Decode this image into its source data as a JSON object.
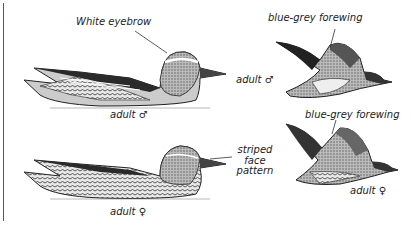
{
  "illustration": {
    "subject": "Garganey ducks",
    "figures": [
      {
        "id": "male-swimming",
        "caption": "adult ♂"
      },
      {
        "id": "female-swimming",
        "caption": "adult ♀"
      },
      {
        "id": "male-flying",
        "caption": "adult ♂"
      },
      {
        "id": "female-flying",
        "caption": "adult ♀"
      }
    ],
    "annotations": {
      "white_eyebrow": "White eyebrow",
      "forewing_male": "blue-grey forewing",
      "forewing_female": "blue-grey forewing",
      "striped_face_line1": "striped",
      "striped_face_line2": "face",
      "striped_face_line3": "pattern"
    },
    "colors": {
      "ink": "#222222",
      "background": "#ffffff"
    }
  }
}
